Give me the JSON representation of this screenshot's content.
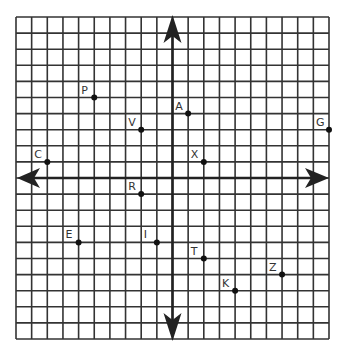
{
  "diagram": {
    "type": "coordinate-plane",
    "grid": {
      "x_min": -10,
      "x_max": 10,
      "y_min": -10,
      "y_max": 10,
      "left_px": 16,
      "top_px": 17,
      "cell_w_px": 15.65,
      "cell_h_px": 16.1,
      "line_color": "#333333",
      "axis_color": "#222222"
    },
    "axes": {
      "x_arrows": [
        "left",
        "right"
      ],
      "y_arrows": [
        "up",
        "down"
      ]
    },
    "points": [
      {
        "label": "P",
        "x": -5,
        "y": 5
      },
      {
        "label": "V",
        "x": -2,
        "y": 3
      },
      {
        "label": "A",
        "x": 1,
        "y": 4
      },
      {
        "label": "G",
        "x": 10,
        "y": 3
      },
      {
        "label": "C",
        "x": -8,
        "y": 1
      },
      {
        "label": "X",
        "x": 2,
        "y": 1
      },
      {
        "label": "R",
        "x": -2,
        "y": -1
      },
      {
        "label": "E",
        "x": -6,
        "y": -4
      },
      {
        "label": "I",
        "x": -1,
        "y": -4
      },
      {
        "label": "T",
        "x": 2,
        "y": -5
      },
      {
        "label": "Z",
        "x": 7,
        "y": -6
      },
      {
        "label": "K",
        "x": 4,
        "y": -7
      }
    ]
  }
}
